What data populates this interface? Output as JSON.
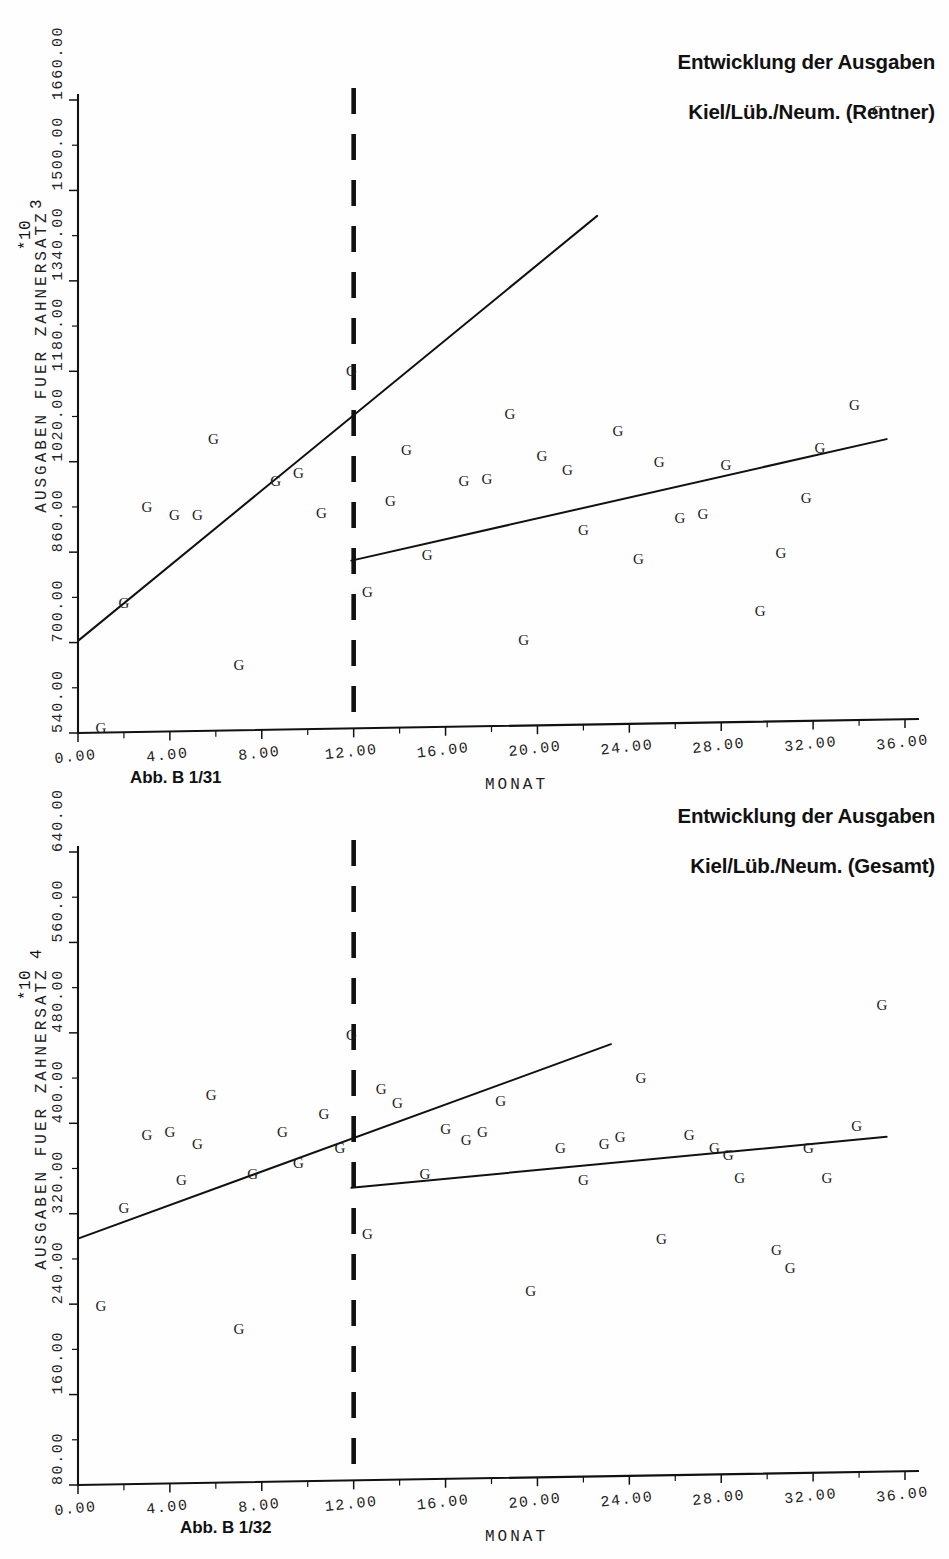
{
  "page": {
    "background": "#ffffff",
    "ink": "#111111"
  },
  "figures": [
    {
      "id": "figure-1",
      "caption": "Abb. B 1/31",
      "title": "Entwicklung der Ausgaben\nKiel/Lüb./Neum. (Rentner)",
      "title_line_1": "Entwicklung der Ausgaben",
      "title_line_2": "Kiel/Lüb./Neum. (Rentner)",
      "chart_data": {
        "type": "scatter",
        "title": "Entwicklung der Ausgaben Kiel/Lüb./Neum. (Rentner)",
        "xlabel": "MONAT",
        "ylabel": "AUSGABEN FUER ZAHNERSATZ",
        "y_multiplier": "*10",
        "y_exponent": "3",
        "xlim": [
          0,
          36
        ],
        "ylim": [
          540,
          1660
        ],
        "xticks": [
          "0.00",
          "4.00",
          "8.00",
          "12.00",
          "16.00",
          "20.00",
          "24.00",
          "28.00",
          "32.00",
          "36.00"
        ],
        "xtick_values": [
          0,
          4,
          8,
          12,
          16,
          20,
          24,
          28,
          32,
          36
        ],
        "yticks": [
          "540.00",
          "700.00",
          "860.00",
          "1020.00",
          "1180.00",
          "1340.00",
          "1500.00",
          "1660.00"
        ],
        "ytick_values": [
          540,
          700,
          860,
          1020,
          1180,
          1340,
          1500,
          1660
        ],
        "grid": false,
        "legend": "none",
        "marker_glyph": "G",
        "intervention_month": 12,
        "annotations": [
          {
            "name": "intervention-break",
            "type": "vertical-dashed-line",
            "x": 12
          }
        ],
        "series": [
          {
            "name": "Beobachtungen",
            "marker": "G",
            "points": [
              {
                "x": 1.0,
                "y": 548
              },
              {
                "x": 2.0,
                "y": 770
              },
              {
                "x": 3.0,
                "y": 940
              },
              {
                "x": 4.2,
                "y": 925
              },
              {
                "x": 5.2,
                "y": 925
              },
              {
                "x": 5.9,
                "y": 1060
              },
              {
                "x": 7.0,
                "y": 660
              },
              {
                "x": 8.6,
                "y": 985
              },
              {
                "x": 9.6,
                "y": 1000
              },
              {
                "x": 10.6,
                "y": 930
              },
              {
                "x": 11.9,
                "y": 1180
              },
              {
                "x": 12.6,
                "y": 790
              },
              {
                "x": 13.6,
                "y": 950
              },
              {
                "x": 14.3,
                "y": 1040
              },
              {
                "x": 15.2,
                "y": 855
              },
              {
                "x": 16.8,
                "y": 985
              },
              {
                "x": 17.8,
                "y": 990
              },
              {
                "x": 18.8,
                "y": 1105
              },
              {
                "x": 19.4,
                "y": 705
              },
              {
                "x": 20.2,
                "y": 1030
              },
              {
                "x": 21.3,
                "y": 1005
              },
              {
                "x": 22.0,
                "y": 900
              },
              {
                "x": 23.5,
                "y": 1075
              },
              {
                "x": 24.4,
                "y": 848
              },
              {
                "x": 25.3,
                "y": 1020
              },
              {
                "x": 26.2,
                "y": 920
              },
              {
                "x": 27.2,
                "y": 928
              },
              {
                "x": 28.2,
                "y": 1015
              },
              {
                "x": 29.7,
                "y": 755
              },
              {
                "x": 30.6,
                "y": 858
              },
              {
                "x": 31.7,
                "y": 955
              },
              {
                "x": 32.3,
                "y": 1045
              },
              {
                "x": 33.8,
                "y": 1120
              },
              {
                "x": 34.8,
                "y": 1640
              }
            ]
          }
        ],
        "regression_lines": [
          {
            "name": "pre-intervention-trend",
            "x0": 0,
            "y0": 703,
            "x1": 22.6,
            "y1": 1455
          },
          {
            "name": "post-intervention-trend",
            "x0": 11.9,
            "y0": 845,
            "x1": 35.2,
            "y1": 1060
          }
        ]
      }
    },
    {
      "id": "figure-2",
      "caption": "Abb. B 1/32",
      "title": "Entwicklung der Ausgaben\nKiel/Lüb./Neum. (Gesamt)",
      "title_line_1": "Entwicklung der Ausgaben",
      "title_line_2": "Kiel/Lüb./Neum. (Gesamt)",
      "chart_data": {
        "type": "scatter",
        "title": "Entwicklung der Ausgaben Kiel/Lüb./Neum. (Gesamt)",
        "xlabel": "MONAT",
        "ylabel": "AUSGABEN FUER ZAHNERSATZ",
        "y_multiplier": "*10",
        "y_exponent": "4",
        "xlim": [
          0,
          36
        ],
        "ylim": [
          80,
          640
        ],
        "xticks": [
          "0.00",
          "4.00",
          "8.00",
          "12.00",
          "16.00",
          "20.00",
          "24.00",
          "28.00",
          "32.00",
          "36.00"
        ],
        "xtick_values": [
          0,
          4,
          8,
          12,
          16,
          20,
          24,
          28,
          32,
          36
        ],
        "yticks": [
          "80.00",
          "160.00",
          "240.00",
          "320.00",
          "400.00",
          "480.00",
          "560.00",
          "640.00"
        ],
        "ytick_values": [
          80,
          160,
          240,
          320,
          400,
          480,
          560,
          640
        ],
        "grid": false,
        "legend": "none",
        "marker_glyph": "G",
        "intervention_month": 12,
        "annotations": [
          {
            "name": "intervention-break",
            "type": "vertical-dashed-line",
            "x": 12
          }
        ],
        "series": [
          {
            "name": "Beobachtungen",
            "marker": "G",
            "points": [
              {
                "x": 1.0,
                "y": 238
              },
              {
                "x": 2.0,
                "y": 325
              },
              {
                "x": 3.0,
                "y": 390
              },
              {
                "x": 4.0,
                "y": 392
              },
              {
                "x": 4.5,
                "y": 350
              },
              {
                "x": 5.2,
                "y": 382
              },
              {
                "x": 5.8,
                "y": 425
              },
              {
                "x": 7.0,
                "y": 218
              },
              {
                "x": 7.6,
                "y": 355
              },
              {
                "x": 8.9,
                "y": 392
              },
              {
                "x": 9.6,
                "y": 365
              },
              {
                "x": 10.7,
                "y": 408
              },
              {
                "x": 11.4,
                "y": 378
              },
              {
                "x": 11.9,
                "y": 478
              },
              {
                "x": 12.6,
                "y": 302
              },
              {
                "x": 13.2,
                "y": 430
              },
              {
                "x": 13.9,
                "y": 418
              },
              {
                "x": 15.1,
                "y": 355
              },
              {
                "x": 16.0,
                "y": 395
              },
              {
                "x": 16.9,
                "y": 385
              },
              {
                "x": 17.6,
                "y": 392
              },
              {
                "x": 18.4,
                "y": 420
              },
              {
                "x": 19.7,
                "y": 252
              },
              {
                "x": 21.0,
                "y": 378
              },
              {
                "x": 22.0,
                "y": 350
              },
              {
                "x": 22.9,
                "y": 382
              },
              {
                "x": 23.6,
                "y": 388
              },
              {
                "x": 24.5,
                "y": 440
              },
              {
                "x": 25.4,
                "y": 298
              },
              {
                "x": 26.6,
                "y": 390
              },
              {
                "x": 27.7,
                "y": 378
              },
              {
                "x": 28.3,
                "y": 372
              },
              {
                "x": 28.8,
                "y": 352
              },
              {
                "x": 30.4,
                "y": 288
              },
              {
                "x": 31.0,
                "y": 272
              },
              {
                "x": 31.8,
                "y": 378
              },
              {
                "x": 32.6,
                "y": 352
              },
              {
                "x": 33.9,
                "y": 398
              },
              {
                "x": 35.0,
                "y": 505
              }
            ]
          }
        ],
        "regression_lines": [
          {
            "name": "pre-intervention-trend",
            "x0": 0,
            "y0": 298,
            "x1": 23.2,
            "y1": 470
          },
          {
            "name": "post-intervention-trend",
            "x0": 11.9,
            "y0": 343,
            "x1": 35.2,
            "y1": 388
          }
        ]
      }
    }
  ]
}
